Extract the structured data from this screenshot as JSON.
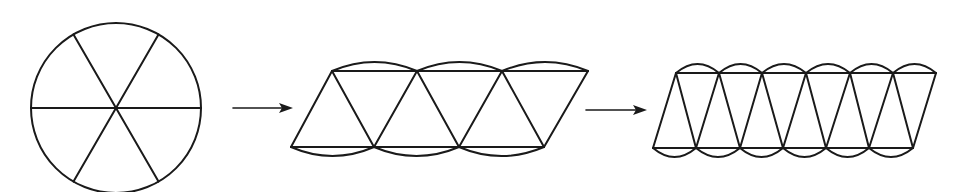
{
  "diagram": {
    "stages": [
      {
        "id": "circle",
        "description": "Circle divided into 6 equal sectors",
        "sectors": 6
      },
      {
        "id": "rearranged-6",
        "description": "6 sectors rearranged alternately into a scalloped parallelogram",
        "sectors": 6
      },
      {
        "id": "rearranged-12",
        "description": "12 sectors rearranged alternately into a near-parallelogram",
        "sectors": 12
      }
    ],
    "arrows": [
      {
        "from": "circle",
        "to": "rearranged-6"
      },
      {
        "from": "rearranged-6",
        "to": "rearranged-12"
      }
    ],
    "colors": {
      "line": "#1a1a1a",
      "background": "#ffffff"
    }
  }
}
